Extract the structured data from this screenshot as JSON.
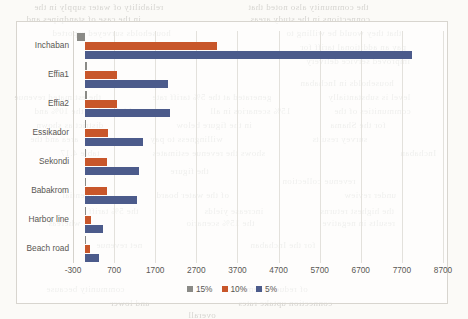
{
  "page": {
    "background_color": "#fbfaf7",
    "frame_border_color": "#d8d5cf"
  },
  "chart_data": {
    "type": "bar",
    "orientation": "horizontal",
    "title": "",
    "subtitle": "",
    "xlabel": "",
    "ylabel": "",
    "grid": true,
    "legend_position": "bottom",
    "xlim": [
      -300,
      8700
    ],
    "xticks": [
      -300,
      700,
      1700,
      2700,
      3700,
      4700,
      5700,
      6700,
      7700,
      8700
    ],
    "xtick_labels": [
      "-300",
      "700",
      "1700",
      "2700",
      "3700",
      "4700",
      "5700",
      "6700",
      "7700",
      "8700"
    ],
    "categories": [
      "Inchaban",
      "Effia1",
      "Effia2",
      "Essikador",
      "Sekondi",
      "Babakrom",
      "Harbor line",
      "Beach road"
    ],
    "series": [
      {
        "name": "15%",
        "color": "#8a8a86",
        "values": [
          -200,
          30,
          30,
          25,
          25,
          20,
          15,
          15
        ]
      },
      {
        "name": "10%",
        "color": "#c8562a",
        "values": [
          3200,
          780,
          770,
          540,
          530,
          520,
          130,
          120
        ]
      },
      {
        "name": "5%",
        "color": "#4c5b8b",
        "values": [
          7950,
          2000,
          2050,
          1400,
          1300,
          1250,
          420,
          330
        ]
      }
    ]
  },
  "legend": {
    "items": [
      {
        "label": "15%",
        "color": "#8a8a86"
      },
      {
        "label": "10%",
        "color": "#c8562a"
      },
      {
        "label": "5%",
        "color": "#4c5b8b"
      }
    ]
  },
  "bleed_through_text": {
    "note": "faint reverse-side text visible through the scanned page",
    "lines": [
      {
        "text": "reliability of water supply in the",
        "x": 34,
        "y": 2,
        "size": 9
      },
      {
        "text": "the community also noted that",
        "x": 248,
        "y": 2,
        "size": 9
      },
      {
        "text": "in the case of standpipes and",
        "x": 26,
        "y": 14,
        "size": 9
      },
      {
        "text": "connections in the study areas",
        "x": 250,
        "y": 14,
        "size": 9
      },
      {
        "text": "households surveyed reported",
        "x": 52,
        "y": 28,
        "size": 9
      },
      {
        "text": "that they would be willing to",
        "x": 286,
        "y": 28,
        "size": 9
      },
      {
        "text": "pay an additional tariff for",
        "x": 300,
        "y": 42,
        "size": 9
      },
      {
        "text": "improved service delivery",
        "x": 306,
        "y": 56,
        "size": 9
      },
      {
        "text": "households in Inchaban",
        "x": 300,
        "y": 78,
        "size": 9
      },
      {
        "text": "the estimated revenue",
        "x": 14,
        "y": 92,
        "size": 9
      },
      {
        "text": "generated at the 5% tariff rate",
        "x": 152,
        "y": 92,
        "size": 9
      },
      {
        "text": "level is substantially",
        "x": 328,
        "y": 92,
        "size": 9
      },
      {
        "text": "higher than the 10% and",
        "x": 34,
        "y": 106,
        "size": 9
      },
      {
        "text": "15% scenarios in all",
        "x": 210,
        "y": 106,
        "size": 9
      },
      {
        "text": "communities of the",
        "x": 334,
        "y": 106,
        "size": 9
      },
      {
        "text": "district as shown",
        "x": 36,
        "y": 120,
        "size": 9
      },
      {
        "text": "in the figure below",
        "x": 176,
        "y": 120,
        "size": 9
      },
      {
        "text": "for the Shama",
        "x": 330,
        "y": 120,
        "size": 9
      },
      {
        "text": "area and the",
        "x": 30,
        "y": 134,
        "size": 9
      },
      {
        "text": "willingness to pay",
        "x": 150,
        "y": 134,
        "size": 9
      },
      {
        "text": "survey results",
        "x": 312,
        "y": 134,
        "size": 9
      },
      {
        "text": "table 4.17",
        "x": 60,
        "y": 148,
        "size": 9
      },
      {
        "text": "shows the revenue estimates",
        "x": 152,
        "y": 148,
        "size": 9
      },
      {
        "text": "Inchaban",
        "x": 400,
        "y": 148,
        "size": 9
      },
      {
        "text": "the figure",
        "x": 170,
        "y": 166,
        "size": 9
      },
      {
        "text": "revenue collection",
        "x": 282,
        "y": 176,
        "size": 9
      },
      {
        "text": "potential",
        "x": 62,
        "y": 190,
        "size": 9
      },
      {
        "text": "of the water board",
        "x": 156,
        "y": 190,
        "size": 9
      },
      {
        "text": "under review",
        "x": 344,
        "y": 190,
        "size": 9
      },
      {
        "text": "the 5% tariff",
        "x": 88,
        "y": 206,
        "size": 9
      },
      {
        "text": "increase yields",
        "x": 204,
        "y": 206,
        "size": 9
      },
      {
        "text": "the highest returns",
        "x": 320,
        "y": 206,
        "size": 9
      },
      {
        "text": "whereas",
        "x": 48,
        "y": 218,
        "size": 9
      },
      {
        "text": "the 15% scenario",
        "x": 186,
        "y": 218,
        "size": 9
      },
      {
        "text": "results in negative",
        "x": 322,
        "y": 218,
        "size": 9
      },
      {
        "text": "net revenue",
        "x": 96,
        "y": 240,
        "size": 9
      },
      {
        "text": "for the Inchaban",
        "x": 250,
        "y": 240,
        "size": 9
      },
      {
        "text": "community because",
        "x": 46,
        "y": 284,
        "size": 9
      },
      {
        "text": "of reduced demand",
        "x": 232,
        "y": 284,
        "size": 9
      },
      {
        "text": "and lower",
        "x": 110,
        "y": 298,
        "size": 9
      },
      {
        "text": "connection uptake rates",
        "x": 238,
        "y": 298,
        "size": 9
      },
      {
        "text": "overall",
        "x": 188,
        "y": 310,
        "size": 9
      }
    ]
  }
}
